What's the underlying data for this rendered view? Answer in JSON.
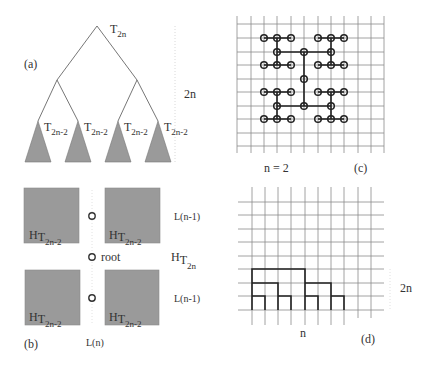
{
  "figure": {
    "colors": {
      "line": "#555555",
      "fill_gray": "#9a9a9a",
      "grid": "#7a7a7a",
      "path": "#222222",
      "dotted": "#cccccc"
    },
    "panel_a": {
      "label": "(a)",
      "root_label": "T",
      "root_sub": "2n",
      "height_label": "2n",
      "subtree_label": "T",
      "subtree_sub": "2n-2",
      "subtree_count": 4
    },
    "panel_b": {
      "label": "(b)",
      "box_label": "H",
      "box_sub_t": "T",
      "box_sub": "2n-2",
      "root_label": "root",
      "side_label_top": "L(n-1)",
      "side_label_bottom": "L(n-1)",
      "whole_label": "H",
      "whole_sub_t": "T",
      "whole_sub": "2n",
      "bottom_label": "L(n)"
    },
    "panel_c": {
      "label": "(c)",
      "n_label": "n = 2"
    },
    "panel_d": {
      "label": "(d)",
      "width_label": "n",
      "height_label": "2n"
    }
  }
}
